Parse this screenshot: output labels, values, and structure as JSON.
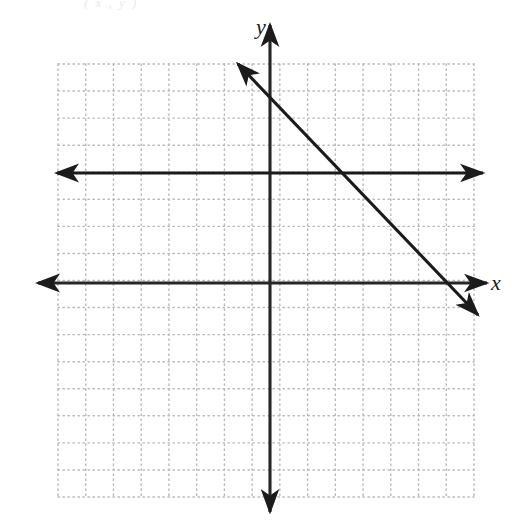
{
  "figure": {
    "width": 524,
    "height": 522,
    "background_color": "#ffffff",
    "top_caption": "( x , y )"
  },
  "labels": {
    "x_axis": "x",
    "y_axis": "y"
  },
  "colors": {
    "line_color": "#1b1b1b",
    "axis_color": "#262626",
    "grid_dot_color": "#b9b9bd",
    "caption_color": "#e9e9ec"
  },
  "chart_data": {
    "type": "line",
    "title": "",
    "xlabel": "x",
    "ylabel": "y",
    "grid": "dotted",
    "grid_spacing_units": 1,
    "legend": "none",
    "xlim": [
      -7.75,
      7.5
    ],
    "ylim": [
      -8.4,
      8.0
    ],
    "plot_area_px": {
      "left": 58,
      "right": 474,
      "top": 64,
      "bottom": 497,
      "cell_px": 27.33,
      "cols": 15,
      "rows": 16
    },
    "origin_px": {
      "x": 270,
      "y": 283
    },
    "axes": [
      {
        "name": "x-axis",
        "orientation": "horizontal",
        "y_value": 0,
        "from_px": [
          38,
          283
        ],
        "to_px": [
          487,
          283
        ],
        "arrows": "both"
      },
      {
        "name": "y-axis",
        "orientation": "vertical",
        "x_value": 0,
        "from_px": [
          270,
          25
        ],
        "to_px": [
          270,
          512
        ],
        "arrows": "both"
      }
    ],
    "series": [
      {
        "name": "horizontal-line",
        "equation": "y = 4",
        "slope": 0,
        "intercept": 4,
        "points": [
          [
            -7.75,
            4
          ],
          [
            7.5,
            4
          ]
        ],
        "from_px": [
          57,
          173
        ],
        "to_px": [
          483,
          173
        ],
        "arrows": "both"
      },
      {
        "name": "diagonal-line",
        "equation": "y = -x + 7",
        "slope": -1,
        "intercept": 7,
        "points": [
          [
            -1.2,
            8.0
          ],
          [
            7.6,
            -1.2
          ]
        ],
        "from_px": [
          238,
          64
        ],
        "to_px": [
          478,
          315
        ],
        "arrows": "both"
      }
    ],
    "intersections": [
      {
        "label": "diagonal-with-horizontal",
        "point_px": [
          348,
          173
        ]
      },
      {
        "label": "diagonal-with-x-axis",
        "point_px": [
          454,
          283
        ]
      },
      {
        "label": "diagonal-with-y-axis",
        "point_px": [
          270,
          96
        ]
      }
    ]
  }
}
